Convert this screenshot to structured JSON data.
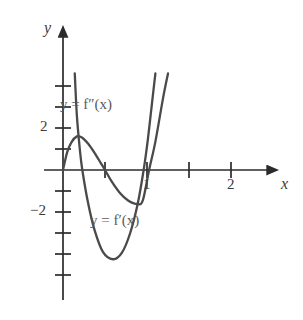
{
  "figure": {
    "background_color": "#ffffff",
    "axis_color": "#2b2b2b",
    "curve_color": "#4a4a4a",
    "label_color": "#3a3a3a",
    "curve_label_color": "#5a5a5a",
    "width": 303,
    "height": 320
  },
  "axes": {
    "x_axis_label": "x",
    "y_axis_label": "y",
    "origin_px": {
      "x": 63,
      "y": 170
    },
    "x_unit_px": 42,
    "y_unit_px": 21,
    "x_tick_labels": [
      "1",
      "2"
    ],
    "y_tick_labels": [
      "2",
      "−2"
    ],
    "x_tick_values": [
      0.5,
      1,
      1.5,
      2
    ],
    "y_tick_values": [
      4,
      3,
      2,
      1,
      -1,
      -2,
      -3,
      -4,
      -5
    ]
  },
  "labels": {
    "f_double_prime": "y = f″(x)",
    "f_prime": "y = f′(x)"
  },
  "chart_data": {
    "type": "line",
    "title": "",
    "xlabel": "x",
    "ylabel": "y",
    "xlim": [
      -0.2,
      2.85
    ],
    "ylim": [
      -5.6,
      4.6
    ],
    "grid": false,
    "legend": "inline-annotations",
    "x_ticks": [
      0.5,
      1,
      1.5,
      2
    ],
    "x_tick_labels": [
      "",
      "1",
      "",
      "2"
    ],
    "y_ticks": [
      -5,
      -4,
      -3,
      -2,
      -1,
      1,
      2,
      3,
      4
    ],
    "y_tick_labels": [
      "",
      "",
      "",
      "−2",
      "",
      "",
      "2",
      "",
      ""
    ],
    "series": [
      {
        "name": "y = f′(x)",
        "kind": "cubic",
        "label_position": {
          "x": 1.55,
          "y": -2.45
        },
        "roots": [
          0.0,
          1.0,
          2.05
        ],
        "local_max": {
          "x": 0.33,
          "y": 1.6
        },
        "local_min": {
          "x": 1.77,
          "y": -1.62
        },
        "points": [
          {
            "x": 0.0,
            "y": 0.0
          },
          {
            "x": 0.1,
            "y": 0.85
          },
          {
            "x": 0.2,
            "y": 1.32
          },
          {
            "x": 0.33,
            "y": 1.6
          },
          {
            "x": 0.45,
            "y": 1.55
          },
          {
            "x": 0.6,
            "y": 1.25
          },
          {
            "x": 0.75,
            "y": 0.82
          },
          {
            "x": 0.9,
            "y": 0.33
          },
          {
            "x": 1.0,
            "y": 0.0
          },
          {
            "x": 1.15,
            "y": -0.52
          },
          {
            "x": 1.35,
            "y": -1.08
          },
          {
            "x": 1.55,
            "y": -1.45
          },
          {
            "x": 1.77,
            "y": -1.62
          },
          {
            "x": 1.9,
            "y": -1.45
          },
          {
            "x": 2.05,
            "y": 0.0
          },
          {
            "x": 2.2,
            "y": 1.35
          },
          {
            "x": 2.38,
            "y": 3.4
          },
          {
            "x": 2.5,
            "y": 4.6
          }
        ]
      },
      {
        "name": "y = f″(x)",
        "kind": "parabola",
        "label_position": {
          "x": 0.95,
          "y": 3.1
        },
        "roots": [
          0.46,
          1.92
        ],
        "vertex": {
          "x": 1.19,
          "y": -4.25
        },
        "points": [
          {
            "x": 0.28,
            "y": 4.6
          },
          {
            "x": 0.33,
            "y": 2.6
          },
          {
            "x": 0.4,
            "y": 1.0
          },
          {
            "x": 0.46,
            "y": 0.0
          },
          {
            "x": 0.6,
            "y": -1.6
          },
          {
            "x": 0.75,
            "y": -2.85
          },
          {
            "x": 0.95,
            "y": -3.9
          },
          {
            "x": 1.19,
            "y": -4.25
          },
          {
            "x": 1.4,
            "y": -3.95
          },
          {
            "x": 1.6,
            "y": -3.0
          },
          {
            "x": 1.78,
            "y": -1.6
          },
          {
            "x": 1.92,
            "y": 0.0
          },
          {
            "x": 2.02,
            "y": 1.45
          },
          {
            "x": 2.12,
            "y": 3.2
          },
          {
            "x": 2.2,
            "y": 4.6
          }
        ]
      }
    ]
  }
}
